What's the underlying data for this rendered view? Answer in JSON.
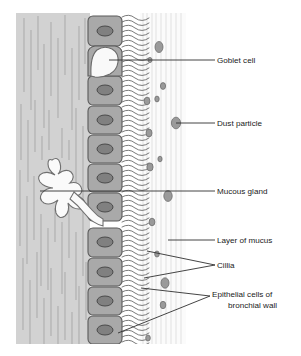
{
  "figure": {
    "type": "biological-diagram",
    "width": 301,
    "height": 356
  },
  "colors": {
    "background": "#ffffff",
    "submucosa_fill": "#d2d2d2",
    "submucosa_fiber": "#a9a9a9",
    "cell_fill": "#a9a9a9",
    "cell_stroke": "#5a5a5a",
    "nucleus_fill": "#808080",
    "nucleus_stroke": "#4a4a4a",
    "goblet_fill": "#f7f7f7",
    "goblet_stroke": "#6a6a6a",
    "gland_fill": "#fafafa",
    "gland_stroke": "#707070",
    "mucus_fill": "#fbfbfb",
    "mucus_streak": "#d8d8d8",
    "cilia_stroke": "#585858",
    "dust_fill": "#9a9a9a",
    "dust_stroke": "#6e6e6e",
    "leader_line": "#303030",
    "label_text": "#1a1a1a"
  },
  "panel": {
    "x": 16,
    "y": 13,
    "width": 170,
    "height": 331
  },
  "labels": [
    {
      "id": "goblet-cell",
      "name": "Goblet cell",
      "lines": [
        "Goblet cell"
      ],
      "text_x": 217,
      "text_y": 63,
      "anchor": "start",
      "leaders": [
        {
          "x1": 215,
          "y1": 60,
          "x2": 109,
          "y2": 60
        }
      ]
    },
    {
      "id": "dust-particle",
      "name": "Dust particle",
      "lines": [
        "Dust particle"
      ],
      "text_x": 217,
      "text_y": 126,
      "anchor": "start",
      "leaders": [
        {
          "x1": 215,
          "y1": 123,
          "x2": 176,
          "y2": 123
        }
      ]
    },
    {
      "id": "mucous-gland",
      "name": "Mucous gland",
      "lines": [
        "Mucous gland"
      ],
      "text_x": 217,
      "text_y": 194,
      "anchor": "start",
      "leaders": [
        {
          "x1": 215,
          "y1": 191,
          "x2": 40,
          "y2": 191
        }
      ]
    },
    {
      "id": "layer-of-mucus",
      "name": "Layer of mucus",
      "lines": [
        "Layer of mucus"
      ],
      "text_x": 217,
      "text_y": 243,
      "anchor": "start",
      "leaders": [
        {
          "x1": 215,
          "y1": 240,
          "x2": 168,
          "y2": 240
        }
      ]
    },
    {
      "id": "cillia",
      "name": "Cillia",
      "lines": [
        "Cillia"
      ],
      "text_x": 217,
      "text_y": 268,
      "anchor": "start",
      "leaders": [
        {
          "x1": 215,
          "y1": 265,
          "x2": 147,
          "y2": 251
        },
        {
          "x1": 215,
          "y1": 265,
          "x2": 144,
          "y2": 278
        }
      ]
    },
    {
      "id": "epithelial-cells",
      "name": "Epithelial cells of bronchial wall",
      "lines": [
        "Epithelial cells of",
        "bronchial wall"
      ],
      "text_x": 212,
      "text_y": 297,
      "anchor": "start",
      "leaders": [
        {
          "x1": 210,
          "y1": 296,
          "x2": 141,
          "y2": 288
        },
        {
          "x1": 210,
          "y1": 296,
          "x2": 118,
          "y2": 333
        }
      ]
    }
  ],
  "epithelial_cells": [
    {
      "x": 88,
      "y": 16,
      "w": 34,
      "h": 30,
      "nucleus_cx": 105,
      "nucleus_cy": 31,
      "nucleus_rx": 8,
      "nucleus_ry": 5
    },
    {
      "x": 88,
      "y": 76,
      "w": 34,
      "h": 29,
      "nucleus_cx": 105,
      "nucleus_cy": 90,
      "nucleus_rx": 8,
      "nucleus_ry": 5
    },
    {
      "x": 88,
      "y": 106,
      "w": 34,
      "h": 28,
      "nucleus_cx": 105,
      "nucleus_cy": 120,
      "nucleus_rx": 8,
      "nucleus_ry": 5
    },
    {
      "x": 88,
      "y": 135,
      "w": 34,
      "h": 28,
      "nucleus_cx": 105,
      "nucleus_cy": 149,
      "nucleus_rx": 8,
      "nucleus_ry": 5
    },
    {
      "x": 88,
      "y": 164,
      "w": 34,
      "h": 28,
      "nucleus_cx": 105,
      "nucleus_cy": 178,
      "nucleus_rx": 8,
      "nucleus_ry": 5
    },
    {
      "x": 88,
      "y": 193,
      "w": 34,
      "h": 28,
      "nucleus_cx": 105,
      "nucleus_cy": 207,
      "nucleus_rx": 8,
      "nucleus_ry": 5
    },
    {
      "x": 88,
      "y": 228,
      "w": 34,
      "h": 29,
      "nucleus_cx": 105,
      "nucleus_cy": 242,
      "nucleus_rx": 8,
      "nucleus_ry": 5
    },
    {
      "x": 88,
      "y": 258,
      "w": 34,
      "h": 28,
      "nucleus_cx": 105,
      "nucleus_cy": 272,
      "nucleus_rx": 8,
      "nucleus_ry": 5
    },
    {
      "x": 88,
      "y": 287,
      "w": 34,
      "h": 28,
      "nucleus_cx": 105,
      "nucleus_cy": 301,
      "nucleus_rx": 8,
      "nucleus_ry": 5
    },
    {
      "x": 88,
      "y": 316,
      "w": 34,
      "h": 28,
      "nucleus_cx": 105,
      "nucleus_cy": 330,
      "nucleus_rx": 8,
      "nucleus_ry": 5
    }
  ],
  "goblet_cell": {
    "x": 88,
    "y": 46,
    "w": 34,
    "h": 30
  },
  "mucous_gland": {
    "center_x": 56,
    "center_y": 186,
    "duct_end_x": 88,
    "duct_end_y": 213
  },
  "dust_particles": [
    {
      "cx": 159,
      "cy": 47,
      "rx": 4.0,
      "ry": 5.5
    },
    {
      "cx": 150,
      "cy": 60,
      "rx": 2.0,
      "ry": 2.6
    },
    {
      "cx": 163,
      "cy": 86,
      "rx": 2.6,
      "ry": 3.4
    },
    {
      "cx": 157,
      "cy": 99,
      "rx": 2.2,
      "ry": 2.9
    },
    {
      "cx": 147,
      "cy": 101,
      "rx": 2.9,
      "ry": 3.8
    },
    {
      "cx": 176,
      "cy": 123,
      "rx": 4.6,
      "ry": 5.8
    },
    {
      "cx": 149,
      "cy": 133,
      "rx": 3.0,
      "ry": 3.9
    },
    {
      "cx": 160,
      "cy": 159,
      "rx": 2.1,
      "ry": 2.8
    },
    {
      "cx": 150,
      "cy": 167,
      "rx": 3.1,
      "ry": 4.0
    },
    {
      "cx": 168,
      "cy": 196,
      "rx": 4.2,
      "ry": 5.4
    },
    {
      "cx": 152,
      "cy": 222,
      "rx": 2.9,
      "ry": 3.8
    },
    {
      "cx": 157,
      "cy": 254,
      "rx": 2.3,
      "ry": 3.0
    },
    {
      "cx": 165,
      "cy": 283,
      "rx": 4.0,
      "ry": 5.2
    },
    {
      "cx": 163,
      "cy": 305,
      "rx": 2.8,
      "ry": 3.7
    },
    {
      "cx": 148,
      "cy": 338,
      "rx": 2.3,
      "ry": 3.0
    }
  ]
}
